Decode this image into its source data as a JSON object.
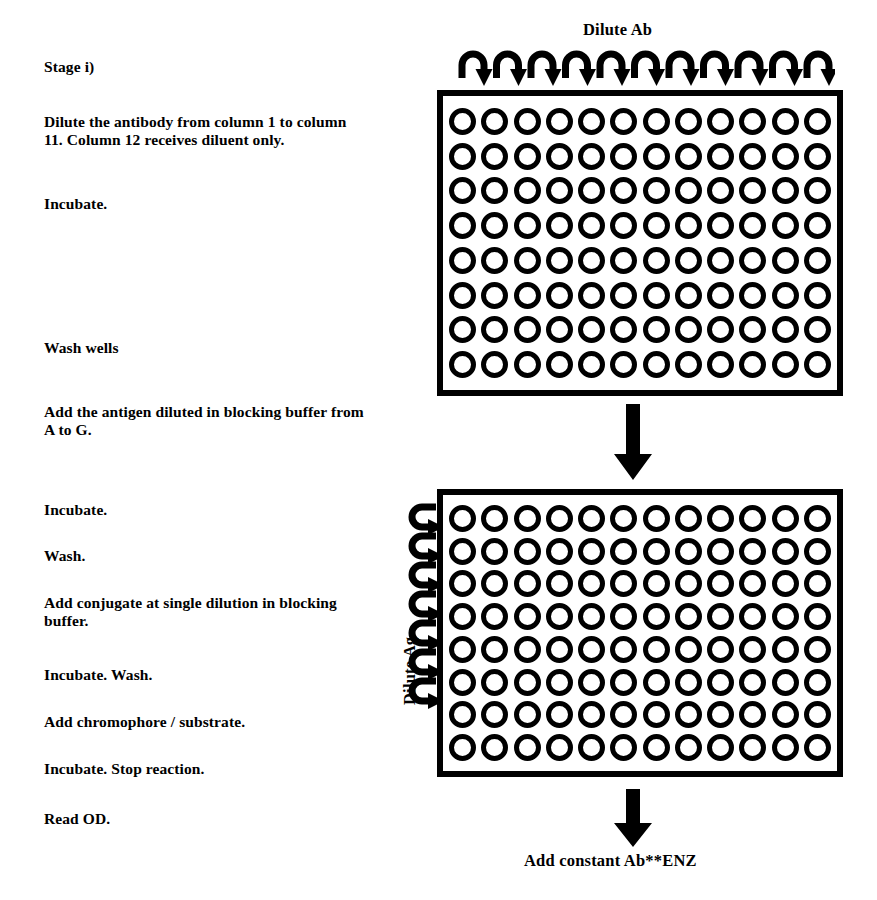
{
  "title": "Checkerboard ELISA titration protocol",
  "protocol": {
    "steps": [
      {
        "id": "stage-label",
        "text": "Stage i)"
      },
      {
        "id": "dilute-antibody",
        "text": "Dilute the antibody from column 1 to column 11. Column 12 receives diluent only."
      },
      {
        "id": "incubate-1",
        "text": "Incubate."
      },
      {
        "id": "wash-wells",
        "text": "Wash wells"
      },
      {
        "id": "add-antigen",
        "text": "Add the antigen diluted in blocking buffer from A to G."
      },
      {
        "id": "incubate-2",
        "text": "Incubate."
      },
      {
        "id": "wash-1",
        "text": "Wash."
      },
      {
        "id": "add-conjugate",
        "text": "Add conjugate at single dilution in blocking buffer."
      },
      {
        "id": "incubate-wash",
        "text": "Incubate. Wash."
      },
      {
        "id": "add-chromophore",
        "text": "Add chromophore / substrate."
      },
      {
        "id": "incubate-stop",
        "text": "Incubate. Stop reaction."
      },
      {
        "id": "read-od",
        "text": "Read OD."
      }
    ]
  },
  "diagram": {
    "top_label": "Dilute Ab",
    "side_label": "Dilute Ag",
    "bottom_label": "Add constant Ab**ENZ",
    "top_arrow_count": 11,
    "side_arrow_count": 7,
    "plate_top": {
      "id": "plate-1",
      "rows": 8,
      "columns": 12,
      "well_glyph": "well-circle"
    },
    "plate_bottom": {
      "id": "plate-2",
      "rows": 8,
      "columns": 12,
      "well_glyph": "well-circle"
    },
    "icons": {
      "top_arc_arrow": "curved-arrow-down-icon",
      "side_arc_arrow": "curved-arrow-right-icon",
      "transfer_arrow": "arrow-down-icon",
      "final_arrow": "arrow-down-icon"
    },
    "colors": {
      "ink": "#000000",
      "background": "#ffffff"
    }
  }
}
